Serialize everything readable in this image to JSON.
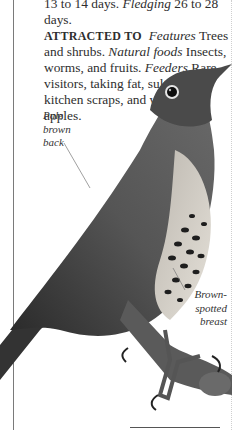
{
  "text": {
    "line1_plain1": "13 to 14 days. ",
    "line1_italic": "Fledging",
    "line1_plain2": "  26 to 28 days.",
    "attracted_heading": "ATTRACTED TO",
    "features_label": "Features",
    "features_text": "  Trees and shrubs. ",
    "natural_foods_label": "Natural foods",
    "natural_foods_text": "  Insects, worms, and fruits. ",
    "feeders_label": "Feeders",
    "feeders_text": "  Rare visitors, taking fat, sultanas, kitchen scraps, and windfall apples."
  },
  "callouts": {
    "back": [
      "Pale",
      "brown",
      "back"
    ],
    "breast": [
      "Brown-",
      "spotted",
      "breast"
    ]
  },
  "illustration": {
    "subject": "song thrush perched on branch",
    "colors": {
      "plumage_dark": "#3a3a3a",
      "plumage_mid": "#6e6e6e",
      "breast_light": "#d8d4cc",
      "spots": "#1e1e1e",
      "branch": "#5a5a5a"
    }
  }
}
